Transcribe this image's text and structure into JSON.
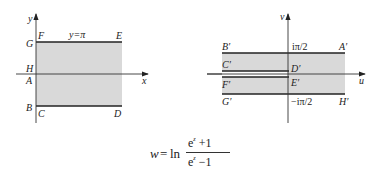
{
  "figure": {
    "left_panel": {
      "axes": {
        "x_label": "x",
        "y_label": "y"
      },
      "line_label": "y=π",
      "points": {
        "A": "A",
        "B": "B",
        "C": "C",
        "D": "D",
        "E": "E",
        "F": "F",
        "G": "G",
        "H": "H"
      },
      "region_fill": "#d9d9d9"
    },
    "right_panel": {
      "axes": {
        "x_label": "u",
        "y_label": "v"
      },
      "top_value": "iπ/2",
      "bottom_value": "−iπ/2",
      "points": {
        "A": "A′",
        "B": "B′",
        "C": "C′",
        "D": "D′",
        "E": "E′",
        "F": "F′",
        "G": "G′",
        "H": "H′"
      },
      "region_fill": "#d9d9d9"
    },
    "formula": {
      "lhs": "w",
      "equals": "=",
      "func": "ln",
      "numerator_base": "e",
      "numerator_exp": "z",
      "numerator_rest": " +1",
      "denominator_base": "e",
      "denominator_exp": "z",
      "denominator_rest": " −1"
    }
  }
}
